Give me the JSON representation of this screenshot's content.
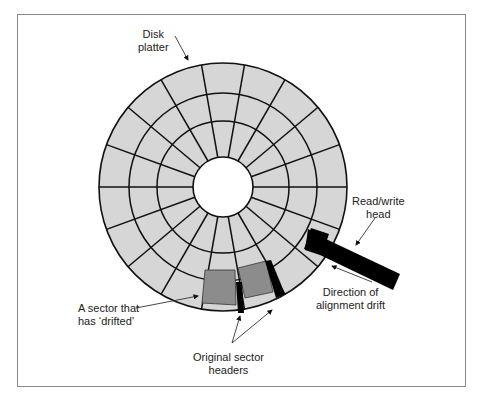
{
  "labels": {
    "disk_platter": [
      "Disk",
      "platter"
    ],
    "read_write_head": [
      "Read/write",
      "head"
    ],
    "direction_drift": [
      "Direction of",
      "alignment drift"
    ],
    "drifted_sector": [
      "A sector that",
      "has ‘drifted’"
    ],
    "original_headers": [
      "Original sector",
      "headers"
    ]
  },
  "colors": {
    "platter_fill": "#d6d6d6",
    "drifted_sector_fill": "#8c8c8c",
    "line": "#111111",
    "frame": "#8a8a8a"
  },
  "geometry": {
    "center": [
      223,
      187
    ],
    "ring_radii": [
      124,
      94,
      66,
      30
    ],
    "sector_angle_deg": 20
  }
}
